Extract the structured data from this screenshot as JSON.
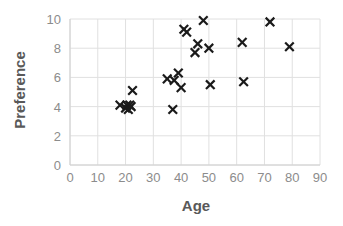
{
  "chart_data": {
    "type": "scatter",
    "title": "",
    "xlabel": "Age",
    "ylabel": "Preference",
    "xlim": [
      0,
      90
    ],
    "ylim": [
      0,
      10
    ],
    "xticks": [
      0,
      10,
      20,
      30,
      40,
      50,
      60,
      70,
      80,
      90
    ],
    "yticks": [
      0,
      2,
      4,
      6,
      8,
      10
    ],
    "grid": true,
    "legend": false,
    "marker": "x",
    "marker_color": "#1a1a1a",
    "series": [
      {
        "name": "Preference vs Age",
        "points": [
          [
            18,
            4.1
          ],
          [
            20,
            3.9
          ],
          [
            20.5,
            4.1
          ],
          [
            21,
            3.8
          ],
          [
            21.5,
            4.1
          ],
          [
            22,
            4.0
          ],
          [
            22.5,
            5.1
          ],
          [
            35,
            5.9
          ],
          [
            37,
            3.8
          ],
          [
            37.5,
            5.8
          ],
          [
            39,
            6.3
          ],
          [
            40,
            5.3
          ],
          [
            41,
            9.3
          ],
          [
            42,
            9.1
          ],
          [
            45,
            7.7
          ],
          [
            46,
            8.3
          ],
          [
            48,
            9.9
          ],
          [
            50,
            8.0
          ],
          [
            50.5,
            5.5
          ],
          [
            62,
            8.4
          ],
          [
            62.5,
            5.7
          ],
          [
            72,
            9.8
          ],
          [
            79,
            8.1
          ]
        ]
      }
    ]
  },
  "axes": {
    "x_title": "Age",
    "y_title": "Preference",
    "x_tick_labels": [
      "0",
      "10",
      "20",
      "30",
      "40",
      "50",
      "60",
      "70",
      "80",
      "90"
    ],
    "y_tick_labels": [
      "0",
      "2",
      "4",
      "6",
      "8",
      "10"
    ]
  },
  "colors": {
    "marker": "#1a1a1a",
    "grid": "#e0e0e0",
    "axis_line": "#d0d0d0",
    "tick_text": "#8c8c8c",
    "title_text": "#595959",
    "background": "#ffffff"
  }
}
